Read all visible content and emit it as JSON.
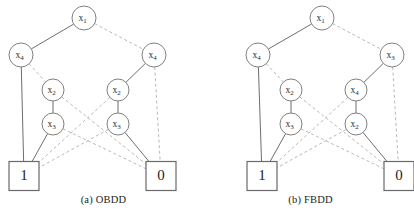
{
  "figure": {
    "width": 413,
    "height": 216,
    "background": "#ffffff",
    "solid_edge_color": "#6e6e6e",
    "dashed_edge_color": "#b9b9b9",
    "node_stroke_color": "#808080",
    "text_color": "#2b2b2b"
  },
  "diagrams": [
    {
      "id": "obdd",
      "caption": "(a) OBDD",
      "nodes": [
        {
          "id": "a-root",
          "label": "x",
          "sub": "1",
          "var": "x1",
          "shape": "circle",
          "cx": 84,
          "cy": 18,
          "r": 12
        },
        {
          "id": "a-l1",
          "label": "x",
          "sub": "4",
          "var": "x4",
          "shape": "circle",
          "cx": 21,
          "cy": 55,
          "r": 12
        },
        {
          "id": "a-r1",
          "label": "x",
          "sub": "4",
          "var": "x4",
          "shape": "circle",
          "cx": 154,
          "cy": 55,
          "r": 12
        },
        {
          "id": "a-l2",
          "label": "x",
          "sub": "2",
          "var": "x2",
          "shape": "circle",
          "cx": 53,
          "cy": 90,
          "r": 11
        },
        {
          "id": "a-r2",
          "label": "x",
          "sub": "2",
          "var": "x2",
          "shape": "circle",
          "cx": 118,
          "cy": 90,
          "r": 11
        },
        {
          "id": "a-l3",
          "label": "x",
          "sub": "3",
          "var": "x3",
          "shape": "circle",
          "cx": 53,
          "cy": 124,
          "r": 11
        },
        {
          "id": "a-r3",
          "label": "x",
          "sub": "3",
          "var": "x3",
          "shape": "circle",
          "cx": 118,
          "cy": 124,
          "r": 11
        },
        {
          "id": "a-one",
          "label": "1",
          "sub": "",
          "var": "1",
          "shape": "box",
          "cx": 24,
          "cy": 176,
          "w": 30,
          "h": 29
        },
        {
          "id": "a-zero",
          "label": "0",
          "sub": "",
          "var": "0",
          "shape": "box",
          "cx": 161,
          "cy": 176,
          "w": 30,
          "h": 29
        }
      ],
      "edges": [
        {
          "from": "a-root",
          "to": "a-l1",
          "style": "solid"
        },
        {
          "from": "a-root",
          "to": "a-r1",
          "style": "dashed"
        },
        {
          "from": "a-l1",
          "to": "a-one",
          "style": "solid"
        },
        {
          "from": "a-l1",
          "to": "a-l2",
          "style": "dashed"
        },
        {
          "from": "a-r1",
          "to": "a-r2",
          "style": "solid"
        },
        {
          "from": "a-r1",
          "to": "a-zero",
          "style": "dashed"
        },
        {
          "from": "a-l2",
          "to": "a-l3",
          "style": "solid"
        },
        {
          "from": "a-l2",
          "to": "a-zero",
          "style": "dashed"
        },
        {
          "from": "a-r2",
          "to": "a-r3",
          "style": "solid"
        },
        {
          "from": "a-r2",
          "to": "a-one",
          "style": "dashed"
        },
        {
          "from": "a-l3",
          "to": "a-one",
          "style": "solid"
        },
        {
          "from": "a-l3",
          "to": "a-zero",
          "style": "dashed"
        },
        {
          "from": "a-r3",
          "to": "a-zero",
          "style": "solid"
        },
        {
          "from": "a-r3",
          "to": "a-one",
          "style": "dashed"
        }
      ]
    },
    {
      "id": "fbdd",
      "caption": "(b) FBDD",
      "nodes": [
        {
          "id": "b-root",
          "label": "x",
          "sub": "1",
          "var": "x1",
          "shape": "circle",
          "cx": 115,
          "cy": 18,
          "r": 12
        },
        {
          "id": "b-l1",
          "label": "x",
          "sub": "4",
          "var": "x4",
          "shape": "circle",
          "cx": 51,
          "cy": 55,
          "r": 12
        },
        {
          "id": "b-r1",
          "label": "x",
          "sub": "3",
          "var": "x3",
          "shape": "circle",
          "cx": 185,
          "cy": 55,
          "r": 12
        },
        {
          "id": "b-l2",
          "label": "x",
          "sub": "2",
          "var": "x2",
          "shape": "circle",
          "cx": 84,
          "cy": 90,
          "r": 11
        },
        {
          "id": "b-r2",
          "label": "x",
          "sub": "4",
          "var": "x4",
          "shape": "circle",
          "cx": 149,
          "cy": 90,
          "r": 11
        },
        {
          "id": "b-l3",
          "label": "x",
          "sub": "3",
          "var": "x3",
          "shape": "circle",
          "cx": 84,
          "cy": 124,
          "r": 11
        },
        {
          "id": "b-r3",
          "label": "x",
          "sub": "2",
          "var": "x2",
          "shape": "circle",
          "cx": 149,
          "cy": 124,
          "r": 11
        },
        {
          "id": "b-one",
          "label": "1",
          "sub": "",
          "var": "1",
          "shape": "box",
          "cx": 55,
          "cy": 176,
          "w": 30,
          "h": 29
        },
        {
          "id": "b-zero",
          "label": "0",
          "sub": "",
          "var": "0",
          "shape": "box",
          "cx": 192,
          "cy": 176,
          "w": 30,
          "h": 29
        }
      ],
      "edges": [
        {
          "from": "b-root",
          "to": "b-l1",
          "style": "solid"
        },
        {
          "from": "b-root",
          "to": "b-r1",
          "style": "dashed"
        },
        {
          "from": "b-l1",
          "to": "b-one",
          "style": "solid"
        },
        {
          "from": "b-l1",
          "to": "b-l2",
          "style": "dashed"
        },
        {
          "from": "b-r1",
          "to": "b-r2",
          "style": "solid"
        },
        {
          "from": "b-r1",
          "to": "b-zero",
          "style": "dashed"
        },
        {
          "from": "b-l2",
          "to": "b-l3",
          "style": "solid"
        },
        {
          "from": "b-l2",
          "to": "b-zero",
          "style": "dashed"
        },
        {
          "from": "b-r2",
          "to": "b-r3",
          "style": "solid"
        },
        {
          "from": "b-r2",
          "to": "b-one",
          "style": "dashed"
        },
        {
          "from": "b-l3",
          "to": "b-one",
          "style": "solid"
        },
        {
          "from": "b-l3",
          "to": "b-zero",
          "style": "dashed"
        },
        {
          "from": "b-r3",
          "to": "b-zero",
          "style": "solid"
        },
        {
          "from": "b-r3",
          "to": "b-one",
          "style": "dashed"
        }
      ]
    }
  ]
}
